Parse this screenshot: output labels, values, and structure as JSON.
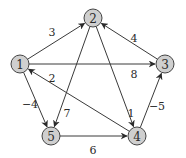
{
  "diagram": {
    "type": "directed-weighted-graph",
    "nodes": [
      {
        "id": "1",
        "label": "1"
      },
      {
        "id": "2",
        "label": "2"
      },
      {
        "id": "3",
        "label": "3"
      },
      {
        "id": "4",
        "label": "4"
      },
      {
        "id": "5",
        "label": "5"
      }
    ],
    "edges": [
      {
        "from": "1",
        "to": "2",
        "weight": "3"
      },
      {
        "from": "1",
        "to": "3",
        "weight": "8"
      },
      {
        "from": "1",
        "to": "5",
        "weight": "−4"
      },
      {
        "from": "2",
        "to": "4",
        "weight": "1"
      },
      {
        "from": "2",
        "to": "5",
        "weight": "7"
      },
      {
        "from": "3",
        "to": "2",
        "weight": "4"
      },
      {
        "from": "4",
        "to": "1",
        "weight": "2"
      },
      {
        "from": "4",
        "to": "3",
        "weight": "−5"
      },
      {
        "from": "5",
        "to": "4",
        "weight": "6"
      }
    ],
    "colors": {
      "node_fill": "#cfcfcf",
      "node_stroke": "#444444",
      "edge": "#3a3a3a",
      "text": "#2a2a2a"
    }
  }
}
